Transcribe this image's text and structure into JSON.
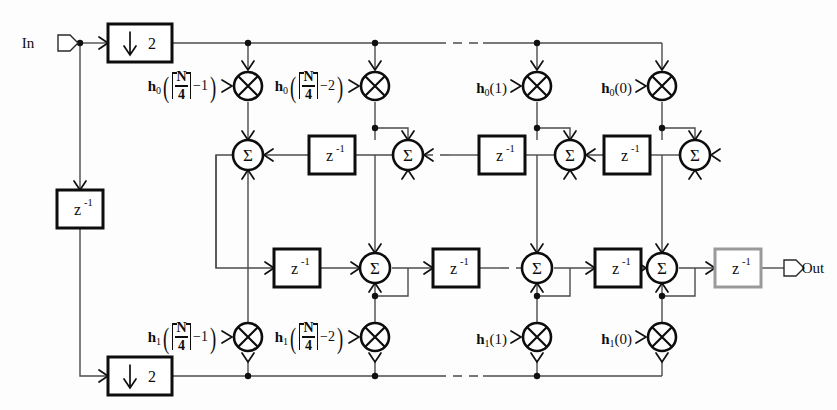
{
  "diagram": {
    "io": {
      "input_label": "In",
      "output_label": "Out"
    },
    "blocks": {
      "downsampler_label": "2",
      "downsampler_arrow": "down-arrow-icon",
      "delay_label_base": "z",
      "delay_label_exp": "-1",
      "sum_symbol": "Σ",
      "mult_symbol": "multiply-cross-icon"
    },
    "notation": {
      "numerator": "N",
      "denominator": "4",
      "ceil_open": "⌈",
      "ceil_close": "⌉"
    },
    "branch0": {
      "name": "h0",
      "base": "h",
      "sub": "0",
      "taps": [
        {
          "id": "h0-ceil-minus-1",
          "kind": "ceil",
          "offset": "−1"
        },
        {
          "id": "h0-ceil-minus-2",
          "kind": "ceil",
          "offset": "−2"
        },
        {
          "id": "h0-index-1",
          "kind": "plain",
          "arg": "(1)"
        },
        {
          "id": "h0-index-0",
          "kind": "plain",
          "arg": "(0)"
        }
      ]
    },
    "branch1": {
      "name": "h1",
      "base": "h",
      "sub": "1",
      "taps": [
        {
          "id": "h1-ceil-minus-1",
          "kind": "ceil",
          "offset": "−1"
        },
        {
          "id": "h1-ceil-minus-2",
          "kind": "ceil",
          "offset": "−2"
        },
        {
          "id": "h1-index-1",
          "kind": "plain",
          "arg": "(1)"
        },
        {
          "id": "h1-index-0",
          "kind": "plain",
          "arg": "(0)"
        }
      ]
    },
    "colors": {
      "ink": "#0d0d0d",
      "wire": "#4b4b4b",
      "soft_border": "#9a9a9a",
      "background": "#fdfdfd"
    },
    "counts": {
      "multipliers": 8,
      "summers": 8,
      "delays": 9,
      "downsamplers": 2
    }
  }
}
